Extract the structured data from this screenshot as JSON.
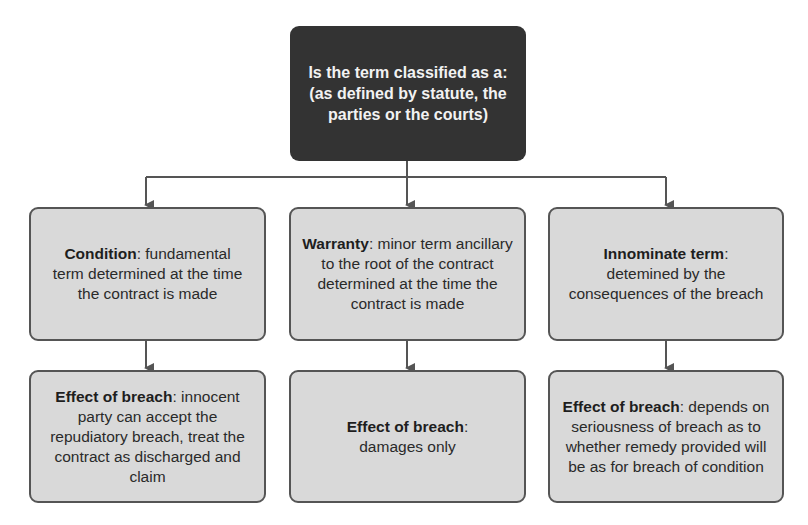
{
  "diagram": {
    "root": {
      "text": "Is the term classified as a: (as defined by statute, the parties or the courts)"
    },
    "columns": [
      {
        "term": {
          "title": "Condition",
          "sep": ": ",
          "body": "fundamental term determined at the time the contract is made"
        },
        "effect": {
          "title": "Effect of breach",
          "sep": ": ",
          "body": "innocent party can accept the repudiatory breach, treat the contract as discharged and claim"
        }
      },
      {
        "term": {
          "title": "Warranty",
          "sep": ": ",
          "body": "minor term ancillary to the root of the contract determined at the time the contract is made"
        },
        "effect": {
          "title": "Effect of breach",
          "sep": ":",
          "body": "damages only"
        }
      },
      {
        "term": {
          "title": "Innominate term",
          "sep": ":",
          "body": "detemined by the consequences of the breach"
        },
        "effect": {
          "title": "Effect of breach",
          "sep": ": ",
          "body": "depends on seriousness of breach as to whether remedy provided will be as for breach of condition"
        }
      }
    ],
    "colors": {
      "root_fill": "#333333",
      "root_text": "#f2f2f2",
      "node_fill": "#d9d9d9",
      "node_border": "#555555",
      "connector": "#555555"
    }
  }
}
